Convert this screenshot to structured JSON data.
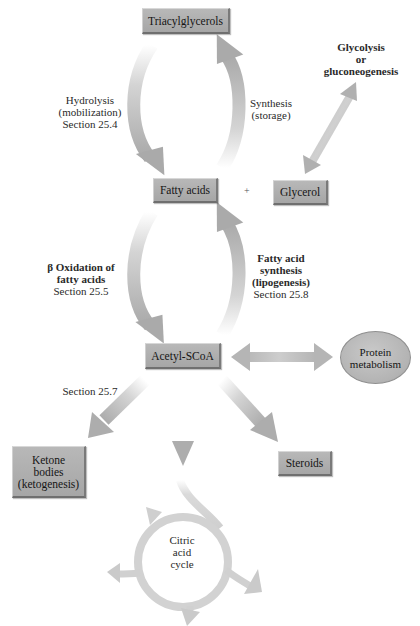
{
  "diagram": {
    "title_cut_off": true,
    "nodes": {
      "triacylglycerols": "Triacylglycerols",
      "fatty_acids": "Fatty acids",
      "plus": "+",
      "glycerol": "Glycerol",
      "acetyl_scoa": "Acetyl-SCoA",
      "protein_metabolism": [
        "Protein",
        "metabolism"
      ],
      "ketone_bodies": [
        "Ketone",
        "bodies",
        "(ketogenesis)"
      ],
      "steroids": "Steroids",
      "citric_acid_cycle": [
        "Citric",
        "acid",
        "cycle"
      ]
    },
    "labels": {
      "hydrolysis": [
        "Hydrolysis",
        "(mobilization)",
        "Section 25.4"
      ],
      "synthesis": [
        "Synthesis",
        "(storage)"
      ],
      "glycolysis": [
        "Glycolysis",
        "or",
        "gluconeogenesis"
      ],
      "beta_oxidation": [
        "β Oxidation of",
        "fatty acids",
        "Section 25.5"
      ],
      "fatty_acid_synthesis": [
        "Fatty acid",
        "synthesis",
        "(lipogenesis)",
        "Section 25.8"
      ],
      "section_257": "Section 25.7"
    },
    "edges": [
      {
        "from": "Triacylglycerols",
        "to": "Fatty acids",
        "label": "Hydrolysis (mobilization) Section 25.4"
      },
      {
        "from": "Fatty acids",
        "to": "Triacylglycerols",
        "label": "Synthesis (storage)"
      },
      {
        "from": "Glycerol",
        "to": "Glycolysis or gluconeogenesis",
        "bidirectional": true
      },
      {
        "from": "Fatty acids",
        "to": "Acetyl-SCoA",
        "label": "β Oxidation of fatty acids Section 25.5"
      },
      {
        "from": "Acetyl-SCoA",
        "to": "Fatty acids",
        "label": "Fatty acid synthesis (lipogenesis) Section 25.8"
      },
      {
        "from": "Acetyl-SCoA",
        "to": "Protein metabolism",
        "bidirectional": true
      },
      {
        "from": "Acetyl-SCoA",
        "to": "Ketone bodies (ketogenesis)",
        "label": "Section 25.7"
      },
      {
        "from": "Acetyl-SCoA",
        "to": "Citric acid cycle"
      },
      {
        "from": "Acetyl-SCoA",
        "to": "Steroids"
      }
    ],
    "colors": {
      "box_fill": "#b0b0b0",
      "arrow": "#b2b2b2",
      "arrow_fade": "#ffffff",
      "text": "#1a1a1a"
    }
  }
}
